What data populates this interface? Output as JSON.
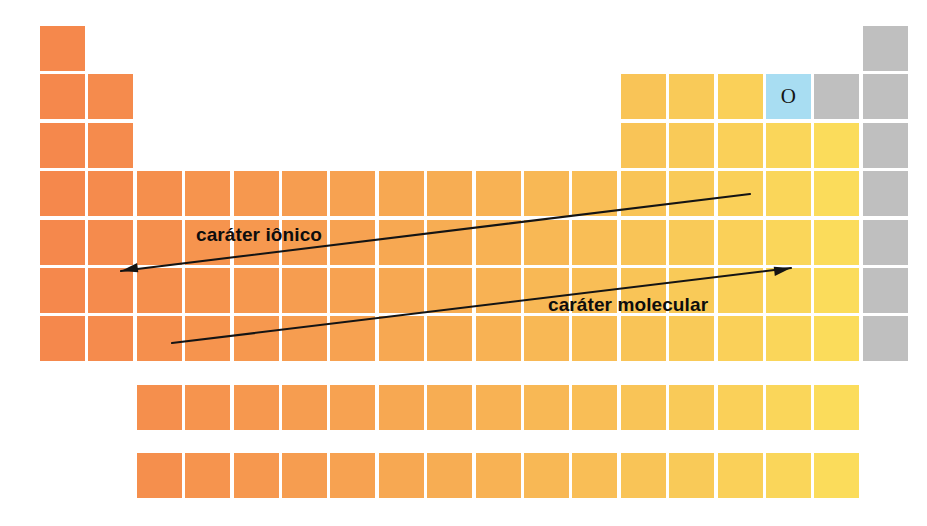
{
  "figure": {
    "type": "periodic-table-trend-diagram",
    "language": "pt-BR",
    "background_color": "#ffffff",
    "width": 927,
    "height": 526
  },
  "grid": {
    "columns": 18,
    "rows": 7,
    "origin_x": 40,
    "origin_y": 26,
    "cell_width": 45,
    "cell_height": 45,
    "gap": 3.4
  },
  "colors": {
    "ionic_end": "#f5884c",
    "molecular_end": "#fbe25c",
    "noble_gas": "#bfbfbf",
    "highlight": "#a8ddf2",
    "arrow": "#141414",
    "gap": "#ffffff"
  },
  "highlighted_cell": {
    "symbol": "O",
    "column": 16,
    "row": 2,
    "fill": "#a8ddf2",
    "text_color": "#151515"
  },
  "main_block_rows": [
    {
      "row": 1,
      "filled_columns": [
        1,
        18
      ]
    },
    {
      "row": 2,
      "filled_columns": [
        1,
        2,
        13,
        14,
        15,
        16,
        17,
        18
      ]
    },
    {
      "row": 3,
      "filled_columns": [
        1,
        2,
        13,
        14,
        15,
        16,
        17,
        18
      ]
    },
    {
      "row": 4,
      "filled_columns": [
        1,
        2,
        3,
        4,
        5,
        6,
        7,
        8,
        9,
        10,
        11,
        12,
        13,
        14,
        15,
        16,
        17,
        18
      ]
    },
    {
      "row": 5,
      "filled_columns": [
        1,
        2,
        3,
        4,
        5,
        6,
        7,
        8,
        9,
        10,
        11,
        12,
        13,
        14,
        15,
        16,
        17,
        18
      ]
    },
    {
      "row": 6,
      "filled_columns": [
        1,
        2,
        3,
        4,
        5,
        6,
        7,
        8,
        9,
        10,
        11,
        12,
        13,
        14,
        15,
        16,
        17,
        18
      ]
    },
    {
      "row": 7,
      "filled_columns": [
        1,
        2,
        3,
        4,
        5,
        6,
        7,
        8,
        9,
        10,
        11,
        12,
        13,
        14,
        15,
        16,
        17,
        18
      ]
    }
  ],
  "inner_block_rows": [
    {
      "name": "lanthanides",
      "y": 385,
      "start_column": 3,
      "count": 15
    },
    {
      "name": "actinides",
      "y": 453,
      "start_column": 3,
      "count": 15
    }
  ],
  "arrows": [
    {
      "id": "ionic",
      "label": "caráter iônico",
      "label_x": 196,
      "label_y": 224,
      "x1": 750,
      "y1": 194,
      "x2": 121,
      "y2": 271,
      "head_at": "end",
      "color": "#141414",
      "stroke_width": 2.1
    },
    {
      "id": "molecular",
      "label": "caráter molecular",
      "label_x": 548,
      "label_y": 294,
      "x1": 172,
      "y1": 343,
      "x2": 791,
      "y2": 268,
      "head_at": "end",
      "color": "#141414",
      "stroke_width": 2.1
    }
  ]
}
